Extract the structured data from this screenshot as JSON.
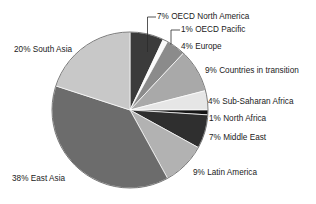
{
  "chart_data": {
    "type": "pie",
    "title": "",
    "xlabel": "",
    "ylabel": "",
    "legend_position": "callout-labels",
    "grid": false,
    "units": "percent",
    "categories": [
      "OECD North America",
      "OECD Pacific",
      "Europe",
      "Countries in transition",
      "Sub-Saharan Africa",
      "North Africa",
      "Middle East",
      "Latin America",
      "East Asia",
      "South Asia"
    ],
    "values": [
      7,
      1,
      4,
      9,
      4,
      1,
      7,
      9,
      38,
      20
    ],
    "colors": [
      "#3b3b3b",
      "#fbfbfb",
      "#8b8b8b",
      "#a9a9a9",
      "#e6e6e6",
      "#151515",
      "#2f2f2f",
      "#b2b2b2",
      "#6c6c6c",
      "#c8c8c8"
    ],
    "slice_labels": [
      "7% OECD North America",
      "1% OECD Pacific",
      "4% Europe",
      "9% Countries in transition",
      "4% Sub-Saharan Africa",
      "1% North Africa",
      "7% Middle East",
      "9% Latin America",
      "38% East Asia",
      "20% South Asia"
    ],
    "start_angle_deg": 0,
    "direction": "clockwise"
  },
  "labels": {
    "oecd_north_america": "7% OECD North America",
    "oecd_pacific": "1% OECD Pacific",
    "europe": "4% Europe",
    "countries_in_transition": "9% Countries in transition",
    "sub_saharan_africa": "4% Sub-Saharan Africa",
    "north_africa": "1% North Africa",
    "middle_east": "7% Middle East",
    "latin_america": "9% Latin America",
    "east_asia": "38% East Asia",
    "south_asia": "20% South Asia"
  }
}
